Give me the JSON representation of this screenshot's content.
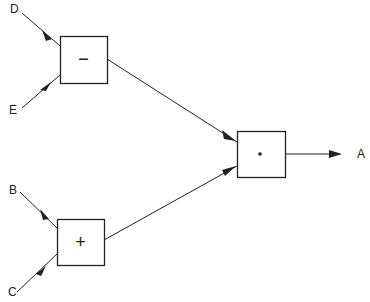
{
  "diagram": {
    "type": "dataflow",
    "nodes": [
      {
        "id": "minus",
        "symbol": "−",
        "x": 60,
        "y": 36,
        "w": 47,
        "h": 47
      },
      {
        "id": "plus",
        "symbol": "+",
        "x": 57,
        "y": 219,
        "w": 47,
        "h": 46
      },
      {
        "id": "times",
        "symbol": "•",
        "x": 237,
        "y": 131,
        "w": 48,
        "h": 46
      }
    ],
    "labels": {
      "D": "D",
      "E": "E",
      "B": "B",
      "C": "C",
      "A": "A"
    },
    "edges": [
      {
        "from": "D",
        "to": "minus"
      },
      {
        "from": "E",
        "to": "minus"
      },
      {
        "from": "B",
        "to": "plus"
      },
      {
        "from": "C",
        "to": "plus"
      },
      {
        "from": "minus",
        "to": "times"
      },
      {
        "from": "plus",
        "to": "times"
      },
      {
        "from": "times",
        "to": "A"
      }
    ],
    "colors": {
      "stroke": "#222222",
      "background": "#ffffff"
    }
  }
}
